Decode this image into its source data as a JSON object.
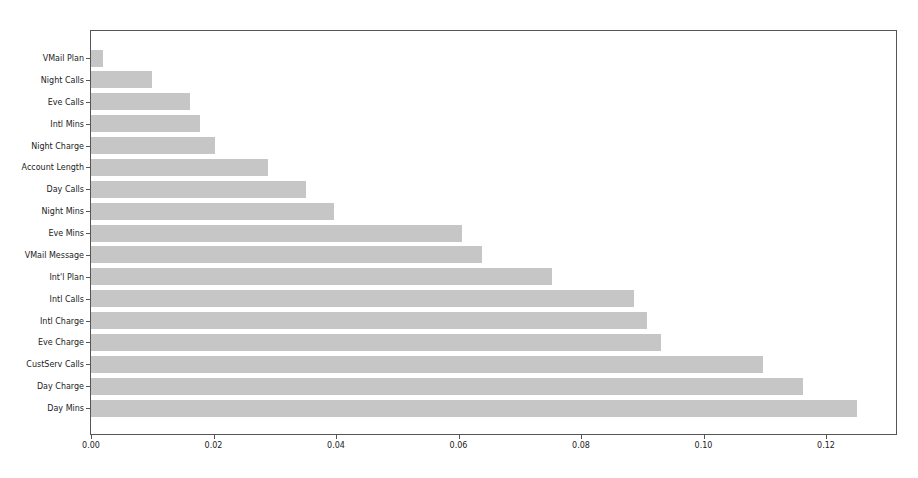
{
  "chart_data": {
    "type": "bar",
    "orientation": "horizontal",
    "title": "",
    "xlabel": "",
    "ylabel": "",
    "xlim": [
      0.0,
      0.1315
    ],
    "grid": false,
    "legend": null,
    "bar_color": "#c6c6c6",
    "categories": [
      "VMail Plan",
      "Night Calls",
      "Eve Calls",
      "Intl Mins",
      "Night Charge",
      "Account Length",
      "Day Calls",
      "Night Mins",
      "Eve Mins",
      "VMail Message",
      "Int'l Plan",
      "Intl Calls",
      "Intl Charge",
      "Eve Charge",
      "CustServ Calls",
      "Day Charge",
      "Day Mins"
    ],
    "values": [
      0.002,
      0.01,
      0.0162,
      0.0178,
      0.0202,
      0.0289,
      0.0351,
      0.0397,
      0.0606,
      0.0638,
      0.0753,
      0.0887,
      0.0908,
      0.0931,
      0.1097,
      0.1162,
      0.1251
    ],
    "xticks": [
      "0.00",
      "0.02",
      "0.04",
      "0.06",
      "0.08",
      "0.10",
      "0.12"
    ],
    "xtick_values": [
      0.0,
      0.02,
      0.04,
      0.06,
      0.08,
      0.1,
      0.12
    ]
  }
}
